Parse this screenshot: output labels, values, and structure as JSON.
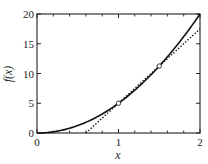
{
  "chart_data": {
    "type": "line",
    "title": "",
    "xlabel": "x",
    "ylabel": "f(x)",
    "xlim": [
      0,
      2
    ],
    "ylim": [
      0,
      20
    ],
    "grid": false,
    "legend": null,
    "x_ticks": [
      0,
      1,
      2
    ],
    "x_tick_labels": [
      "0",
      "1",
      "2"
    ],
    "x_minor_ticks": [
      0.2,
      0.4,
      0.6,
      0.8,
      1.2,
      1.4,
      1.6,
      1.8
    ],
    "y_ticks": [
      0,
      5,
      10,
      15,
      20
    ],
    "y_tick_labels": [
      "0",
      "5",
      "10",
      "15",
      "20"
    ],
    "series": [
      {
        "name": "f(x) = 5x^2",
        "style": "solid",
        "color": "#111111",
        "x": [
          0,
          0.25,
          0.5,
          0.75,
          1.0,
          1.25,
          1.5,
          1.75,
          2.0
        ],
        "values": [
          0,
          0.3125,
          1.25,
          2.8125,
          5,
          7.8125,
          11.25,
          15.3125,
          20
        ]
      },
      {
        "name": "secant line",
        "style": "dotted",
        "color": "#111111",
        "x": [
          0.6,
          2.0
        ],
        "values": [
          0,
          17.5
        ]
      }
    ],
    "markers": [
      {
        "x": 1.0,
        "y": 5,
        "shape": "open-circle"
      },
      {
        "x": 1.5,
        "y": 11.25,
        "shape": "open-circle"
      }
    ]
  },
  "axes": {
    "xlabel": "x",
    "ylabel": "f(x)",
    "x_tick_labels": [
      "0",
      "1",
      "2"
    ],
    "y_tick_labels": [
      "0",
      "5",
      "10",
      "15",
      "20"
    ]
  }
}
